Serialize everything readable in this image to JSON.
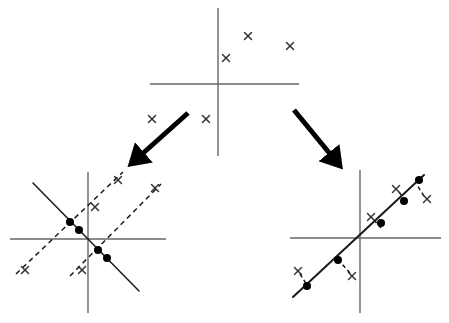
{
  "figure": {
    "title": "",
    "background": "#ffffff",
    "stroke_axis": "#666666",
    "stroke_line": "#1a1a1a",
    "stroke_dash": "#1a1a1a",
    "marker_x_color": "#333333",
    "dot_color": "#000000",
    "arrow_color": "#000000"
  },
  "panels": [
    {
      "id": "top-scatter",
      "name": "original-data-panel",
      "label": "",
      "axes": {
        "x_axis": {
          "x1": 150,
          "y1": 84,
          "x2": 299,
          "y2": 84
        },
        "y_axis": {
          "x1": 218,
          "y1": 8,
          "x2": 218,
          "y2": 156
        }
      },
      "x_markers": [
        {
          "cx": 248,
          "cy": 36,
          "size": 7
        },
        {
          "cx": 290,
          "cy": 46,
          "size": 7
        },
        {
          "cx": 226,
          "cy": 58,
          "size": 7
        },
        {
          "cx": 152,
          "cy": 119,
          "size": 7
        },
        {
          "cx": 206,
          "cy": 119,
          "size": 7
        }
      ],
      "lines": [],
      "dashed_lines": [],
      "dots": []
    },
    {
      "id": "bottom-left",
      "name": "candidate-projections-panel",
      "label": "",
      "axes": {
        "x_axis": {
          "x1": 10,
          "y1": 239,
          "x2": 166,
          "y2": 239
        },
        "y_axis": {
          "x1": 88,
          "y1": 172,
          "x2": 88,
          "y2": 313
        }
      },
      "x_markers": [
        {
          "cx": 25,
          "cy": 270,
          "size": 7
        },
        {
          "cx": 82,
          "cy": 270,
          "size": 7
        },
        {
          "cx": 95,
          "cy": 207,
          "size": 7
        },
        {
          "cx": 118,
          "cy": 180,
          "size": 7
        },
        {
          "cx": 155,
          "cy": 188,
          "size": 7
        }
      ],
      "lines": [
        {
          "x1": 33,
          "y1": 183,
          "x2": 139,
          "y2": 291,
          "width": 1.5
        }
      ],
      "dashed_lines": [
        {
          "x1": 16,
          "y1": 274,
          "x2": 123,
          "y2": 172,
          "width": 1.5,
          "dash": "5,4"
        },
        {
          "x1": 70,
          "y1": 276,
          "x2": 161,
          "y2": 184,
          "width": 1.5,
          "dash": "5,4"
        }
      ],
      "dots": [
        {
          "cx": 70,
          "cy": 222,
          "r": 4
        },
        {
          "cx": 79,
          "cy": 230,
          "r": 4
        },
        {
          "cx": 98,
          "cy": 250,
          "r": 4
        },
        {
          "cx": 107,
          "cy": 258,
          "r": 4
        }
      ]
    },
    {
      "id": "bottom-right",
      "name": "fitted-projection-panel",
      "label": "",
      "axes": {
        "x_axis": {
          "x1": 290,
          "y1": 238,
          "x2": 441,
          "y2": 238
        },
        "y_axis": {
          "x1": 360,
          "y1": 170,
          "x2": 360,
          "y2": 313
        }
      },
      "x_markers": [
        {
          "cx": 298,
          "cy": 271,
          "size": 7
        },
        {
          "cx": 352,
          "cy": 276,
          "size": 7
        },
        {
          "cx": 371,
          "cy": 217,
          "size": 7
        },
        {
          "cx": 396,
          "cy": 189,
          "size": 7
        },
        {
          "cx": 427,
          "cy": 199,
          "size": 7
        }
      ],
      "lines": [
        {
          "x1": 293,
          "y1": 297,
          "x2": 424,
          "y2": 175,
          "width": 2
        }
      ],
      "dashed_lines": [
        {
          "x1": 300,
          "y1": 274,
          "x2": 307,
          "y2": 285,
          "width": 1.5,
          "dash": "4,3"
        },
        {
          "x1": 350,
          "y1": 273,
          "x2": 341,
          "y2": 263,
          "width": 1.5,
          "dash": "4,3"
        },
        {
          "x1": 374,
          "y1": 220,
          "x2": 381,
          "y2": 228,
          "width": 1.5,
          "dash": "4,3"
        },
        {
          "x1": 399,
          "y1": 192,
          "x2": 405,
          "y2": 200,
          "width": 1.5,
          "dash": "4,3"
        },
        {
          "x1": 424,
          "y1": 196,
          "x2": 417,
          "y2": 185,
          "width": 1.5,
          "dash": "4,3"
        }
      ],
      "dots": [
        {
          "cx": 307,
          "cy": 286,
          "r": 4
        },
        {
          "cx": 338,
          "cy": 260,
          "r": 4
        },
        {
          "cx": 381,
          "cy": 223,
          "r": 4
        },
        {
          "cx": 404,
          "cy": 201,
          "r": 4
        },
        {
          "cx": 419,
          "cy": 180,
          "r": 4
        }
      ]
    }
  ],
  "arrows": [
    {
      "id": "arrow-left",
      "name": "arrow-to-left-panel",
      "x1": 188,
      "y1": 113,
      "x2": 131,
      "y2": 164,
      "width": 5,
      "head": 13
    },
    {
      "id": "arrow-right",
      "name": "arrow-to-right-panel",
      "x1": 294,
      "y1": 110,
      "x2": 340,
      "y2": 166,
      "width": 5,
      "head": 13
    }
  ]
}
